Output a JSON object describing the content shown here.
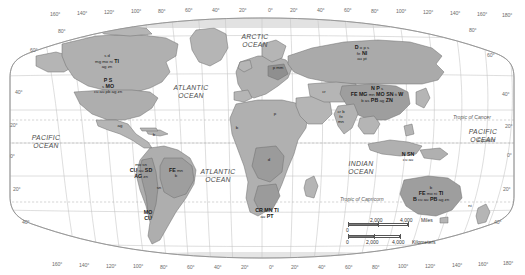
{
  "map": {
    "title": "World mineral resources map",
    "projection": "oval / Robinson-style world projection",
    "land_color": "#b3b3b3",
    "highlight_color": "#9a9a9a",
    "water_color": "#ffffff",
    "grid_color": "#b9b9b9",
    "outline_color": "#7f7f7f"
  },
  "graticule": {
    "top_longitudes": [
      "160°",
      "140°",
      "120°",
      "100°",
      "80°",
      "60°",
      "40°",
      "20°",
      "0°",
      "20°",
      "40°",
      "60°",
      "80°",
      "100°",
      "120°",
      "140°",
      "160°",
      "180°"
    ],
    "bottom_longitudes": [
      "160°",
      "140°",
      "120°",
      "100°",
      "80°",
      "60°",
      "40°",
      "20°",
      "0°",
      "20°",
      "40°",
      "60°",
      "80°",
      "100°",
      "120°",
      "140°",
      "160°",
      "180°"
    ],
    "left_latitudes": [
      "60°",
      "40°",
      "20°",
      "0°",
      "20°",
      "40°"
    ],
    "right_latitudes": [
      "80°",
      "60°",
      "40°",
      "20°",
      "0°",
      "20°",
      "40°"
    ],
    "inner_left_80": "80°",
    "inner_left_60": "60°",
    "inner_left_40": "40°",
    "inner_left_20": "20°"
  },
  "oceans": [
    {
      "id": "arctic",
      "line1": "ARCTIC",
      "line2": "OCEAN"
    },
    {
      "id": "atlantic-north",
      "line1": "ATLANTIC",
      "line2": "OCEAN"
    },
    {
      "id": "atlantic-south",
      "line1": "ATLANTIC",
      "line2": "OCEAN"
    },
    {
      "id": "pacific-west",
      "line1": "PACIFIC",
      "line2": "OCEAN"
    },
    {
      "id": "pacific-east",
      "line1": "PACIFIC",
      "line2": "OCEAN"
    },
    {
      "id": "indian",
      "line1": "INDIAN",
      "line2": "OCEAN"
    }
  ],
  "reference_lines": {
    "tropic_of_cancer": "Tropic of Cancer",
    "equator": "Equator",
    "tropic_of_capricorn": "Tropic of Capricorn"
  },
  "resource_labels": [
    {
      "id": "canada",
      "rows": [
        [
          {
            "t": "s",
            "w": "min"
          },
          {
            "t": "d",
            "w": "min"
          }
        ],
        [
          {
            "t": "mg",
            "w": "min"
          },
          {
            "t": "mo",
            "w": "min"
          },
          {
            "t": "ni",
            "w": "min"
          },
          {
            "t": "TI",
            "w": "maj"
          }
        ],
        [
          {
            "t": "ag",
            "w": "min"
          },
          {
            "t": "zn",
            "w": "min"
          }
        ]
      ]
    },
    {
      "id": "united-states",
      "rows": [
        [
          {
            "t": "P",
            "w": "maj"
          },
          {
            "t": "S",
            "w": "maj"
          }
        ],
        [
          {
            "t": "s",
            "w": "min"
          },
          {
            "t": "MO",
            "w": "maj"
          }
        ],
        [
          {
            "t": "cu",
            "w": "min"
          },
          {
            "t": "au",
            "w": "min"
          },
          {
            "t": "pb",
            "w": "min"
          },
          {
            "t": "ag",
            "w": "min"
          },
          {
            "t": "zn",
            "w": "min"
          }
        ]
      ]
    },
    {
      "id": "mexico",
      "rows": [
        [
          {
            "t": "ag",
            "w": "min"
          }
        ]
      ]
    },
    {
      "id": "caribbean",
      "rows": [
        [
          {
            "t": "b",
            "w": "min"
          }
        ]
      ]
    },
    {
      "id": "andes-west",
      "rows": [
        [
          {
            "t": "mo",
            "w": "min"
          },
          {
            "t": "sn",
            "w": "min"
          }
        ],
        [
          {
            "t": "CU",
            "w": "maj"
          },
          {
            "t": "au",
            "w": "min"
          },
          {
            "t": "SD",
            "w": "maj"
          }
        ],
        [
          {
            "t": "AG",
            "w": "maj"
          },
          {
            "t": "zn",
            "w": "min"
          }
        ]
      ]
    },
    {
      "id": "brazil",
      "rows": [
        [
          {
            "t": "FE",
            "w": "maj"
          },
          {
            "t": "mn",
            "w": "min"
          }
        ],
        [
          {
            "t": "b",
            "w": "min"
          }
        ]
      ]
    },
    {
      "id": "bolivia",
      "rows": [
        [
          {
            "t": "sn",
            "w": "min"
          }
        ]
      ]
    },
    {
      "id": "chile-argentina",
      "rows": [
        [
          {
            "t": "MO",
            "w": "maj"
          }
        ],
        [
          {
            "t": "CU",
            "w": "maj"
          }
        ]
      ]
    },
    {
      "id": "europe",
      "rows": [
        [
          {
            "t": "p",
            "w": "min"
          },
          {
            "t": "mm",
            "w": "min"
          }
        ]
      ]
    },
    {
      "id": "west-africa",
      "rows": [
        [
          {
            "t": "b",
            "w": "min"
          }
        ]
      ]
    },
    {
      "id": "north-africa",
      "rows": [
        [
          {
            "t": "p",
            "w": "min"
          }
        ]
      ]
    },
    {
      "id": "central-africa",
      "rows": [
        [
          {
            "t": "d",
            "w": "min"
          }
        ]
      ]
    },
    {
      "id": "southern-africa",
      "rows": [
        [
          {
            "t": "CR",
            "w": "maj"
          },
          {
            "t": "MN",
            "w": "maj"
          },
          {
            "t": "TI",
            "w": "maj"
          }
        ],
        [
          {
            "t": "au",
            "w": "min"
          },
          {
            "t": "PT",
            "w": "maj"
          }
        ]
      ]
    },
    {
      "id": "russia",
      "rows": [
        [
          {
            "t": "D",
            "w": "maj"
          },
          {
            "t": "o",
            "w": "min"
          },
          {
            "t": "p",
            "w": "min"
          },
          {
            "t": "s",
            "w": "min"
          }
        ],
        [
          {
            "t": "fe",
            "w": "min"
          },
          {
            "t": "NI",
            "w": "maj"
          }
        ],
        [
          {
            "t": "au",
            "w": "min"
          },
          {
            "t": "pt",
            "w": "min"
          }
        ]
      ]
    },
    {
      "id": "central-asia",
      "rows": [
        [
          {
            "t": "cr",
            "w": "min"
          }
        ]
      ]
    },
    {
      "id": "china",
      "rows": [
        [
          {
            "t": "N",
            "w": "maj"
          },
          {
            "t": "P",
            "w": "maj"
          },
          {
            "t": "s",
            "w": "min"
          }
        ],
        [
          {
            "t": "FE",
            "w": "maj"
          },
          {
            "t": "MG",
            "w": "maj"
          },
          {
            "t": "mn",
            "w": "min"
          },
          {
            "t": "MO",
            "w": "maj"
          },
          {
            "t": "SN",
            "w": "maj"
          },
          {
            "t": "ti",
            "w": "min"
          },
          {
            "t": "W",
            "w": "maj"
          }
        ],
        [
          {
            "t": "b",
            "w": "min"
          },
          {
            "t": "as",
            "w": "min"
          },
          {
            "t": "PB",
            "w": "maj"
          },
          {
            "t": "ag",
            "w": "min"
          },
          {
            "t": "ZN",
            "w": "maj"
          }
        ]
      ]
    },
    {
      "id": "india",
      "rows": [
        [
          {
            "t": "cr",
            "w": "min"
          },
          {
            "t": "b",
            "w": "min"
          }
        ],
        [
          {
            "t": "fe",
            "w": "min"
          }
        ],
        [
          {
            "t": "mn",
            "w": "min"
          }
        ]
      ]
    },
    {
      "id": "indonesia",
      "rows": [
        [
          {
            "t": "N",
            "w": "maj"
          },
          {
            "t": "SN",
            "w": "maj"
          }
        ],
        [
          {
            "t": "cu",
            "w": "min"
          },
          {
            "t": "au",
            "w": "min"
          }
        ]
      ]
    },
    {
      "id": "new-zealand",
      "rows": [
        [
          {
            "t": "ni",
            "w": "min"
          }
        ]
      ]
    },
    {
      "id": "australia",
      "rows": [
        [
          {
            "t": "b",
            "w": "min"
          }
        ],
        [
          {
            "t": "FE",
            "w": "maj"
          },
          {
            "t": "mo",
            "w": "min"
          },
          {
            "t": "ni",
            "w": "min"
          },
          {
            "t": "TI",
            "w": "maj"
          }
        ],
        [
          {
            "t": "B",
            "w": "maj"
          },
          {
            "t": "cu",
            "w": "min"
          },
          {
            "t": "au",
            "w": "min"
          },
          {
            "t": "PB",
            "w": "maj"
          },
          {
            "t": "ag",
            "w": "min"
          },
          {
            "t": "zn",
            "w": "min"
          }
        ]
      ]
    }
  ],
  "scale": {
    "miles": {
      "zero": "0",
      "mid": "2,000",
      "end": "4,000",
      "unit": "Miles"
    },
    "kilometers": {
      "zero": "0",
      "mid": "2,000",
      "end": "4,000",
      "unit": "Kilometers"
    }
  }
}
